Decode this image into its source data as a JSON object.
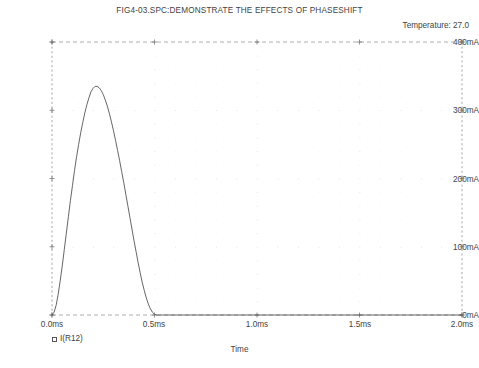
{
  "header": {
    "title": "FIG4-03.SPC:DEMONSTRATE THE EFFECTS OF PHASESHIFT",
    "temperature": "Temperature:  27.0"
  },
  "axes": {
    "xlabel": "Time",
    "y_ticks": [
      "400mA",
      "300mA",
      "200mA",
      "100mA",
      "-0mA"
    ],
    "x_ticks": [
      "0.0ms",
      "0.5ms",
      "1.0ms",
      "1.5ms",
      "2.0ms"
    ]
  },
  "legend": {
    "marker": "square-marker",
    "label": "I(R12)"
  },
  "chart_data": {
    "type": "line",
    "title": "FIG4-03.SPC:DEMONSTRATE THE EFFECTS OF PHASESHIFT",
    "subtitle": "Temperature:  27.0",
    "xlabel": "Time",
    "ylabel": "",
    "xlim": [
      0.0,
      2.0
    ],
    "ylim": [
      0,
      400
    ],
    "x_unit": "ms",
    "y_unit": "mA",
    "grid": true,
    "legend_position": "below-left",
    "x_tick_values": [
      0.0,
      0.5,
      1.0,
      1.5,
      2.0
    ],
    "y_tick_values": [
      0,
      100,
      200,
      300,
      400
    ],
    "series": [
      {
        "name": "I(R12)",
        "color": "#555555",
        "x": [
          0.0,
          0.01,
          0.02,
          0.03,
          0.04,
          0.05,
          0.06,
          0.07,
          0.08,
          0.09,
          0.1,
          0.11,
          0.12,
          0.13,
          0.14,
          0.15,
          0.16,
          0.17,
          0.18,
          0.19,
          0.2,
          0.21,
          0.22,
          0.23,
          0.24,
          0.25,
          0.26,
          0.27,
          0.28,
          0.29,
          0.3,
          0.31,
          0.32,
          0.33,
          0.34,
          0.35,
          0.36,
          0.37,
          0.38,
          0.39,
          0.4,
          0.41,
          0.42,
          0.43,
          0.44,
          0.45,
          0.46,
          0.47,
          0.48,
          0.49,
          0.5,
          0.51,
          0.52,
          0.55,
          0.6,
          0.7,
          0.8,
          0.9,
          1.0,
          1.2,
          1.4,
          1.6,
          1.8,
          2.0
        ],
        "y": [
          0,
          4,
          14,
          30,
          50,
          72,
          96,
          120,
          144,
          168,
          190,
          212,
          232,
          250,
          267,
          282,
          296,
          308,
          318,
          327,
          332,
          335,
          335,
          333,
          329,
          323,
          315,
          306,
          295,
          283,
          270,
          256,
          241,
          226,
          210,
          194,
          177,
          160,
          143,
          126,
          109,
          93,
          77,
          62,
          48,
          36,
          25,
          16,
          9,
          4,
          1,
          0,
          0,
          0,
          0,
          0,
          0,
          0,
          0,
          0,
          0,
          0,
          0,
          0
        ]
      }
    ],
    "annotations": {
      "peak_value_mA": 335,
      "peak_time_ms": 0.22,
      "pulse_end_time_ms": 0.52
    }
  }
}
